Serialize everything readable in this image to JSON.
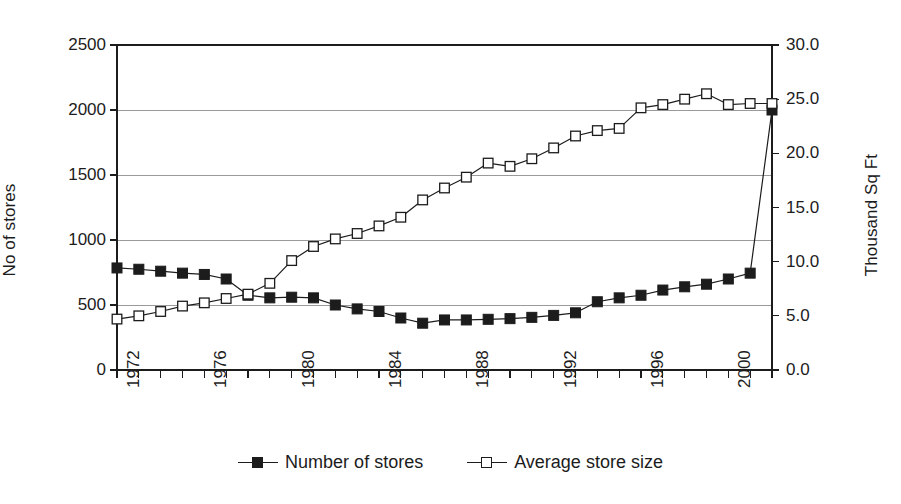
{
  "chart_data": {
    "type": "line",
    "title": "",
    "xlabel": "",
    "ylabel": "No of stores",
    "y2label": "Thousand Sq Ft",
    "grid": true,
    "legend_position": "bottom",
    "xlim": [
      1972,
      2002
    ],
    "ylim": [
      0,
      2500
    ],
    "y2lim": [
      0,
      30
    ],
    "x_tick_labels": [
      "1972",
      "1976",
      "1980",
      "1984",
      "1988",
      "1992",
      "1996",
      "2000"
    ],
    "x_tick_values": [
      1972,
      1976,
      1980,
      1984,
      1988,
      1992,
      1996,
      2000
    ],
    "y_tick_labels": [
      "0",
      "500",
      "1000",
      "1500",
      "2000",
      "2500"
    ],
    "y_tick_values": [
      0,
      500,
      1000,
      1500,
      2000,
      2500
    ],
    "y2_tick_labels": [
      "0.0",
      "5.0",
      "10.0",
      "15.0",
      "20.0",
      "25.0",
      "30.0"
    ],
    "y2_tick_values": [
      0,
      5,
      10,
      15,
      20,
      25,
      30
    ],
    "x": [
      1972,
      1973,
      1974,
      1975,
      1976,
      1977,
      1978,
      1979,
      1980,
      1981,
      1982,
      1983,
      1984,
      1985,
      1986,
      1987,
      1988,
      1989,
      1990,
      1991,
      1992,
      1993,
      1994,
      1995,
      1996,
      1997,
      1998,
      1999,
      2000,
      2001,
      2002
    ],
    "series": [
      {
        "name": "Number of stores",
        "axis": "left",
        "marker": "filled-square",
        "values": [
          785,
          775,
          760,
          745,
          735,
          700,
          575,
          555,
          560,
          555,
          500,
          470,
          450,
          400,
          360,
          385,
          385,
          390,
          395,
          405,
          420,
          440,
          525,
          555,
          575,
          615,
          640,
          660,
          700,
          745,
          2000
        ]
      },
      {
        "name": "Average store size",
        "axis": "right",
        "marker": "open-square",
        "values": [
          4.7,
          5.0,
          5.4,
          5.9,
          6.2,
          6.6,
          7.0,
          8.0,
          10.1,
          11.4,
          12.1,
          12.6,
          13.3,
          14.1,
          15.7,
          16.8,
          17.8,
          19.1,
          18.8,
          19.5,
          20.5,
          21.6,
          22.1,
          22.3,
          24.2,
          24.5,
          25.0,
          25.5,
          24.5,
          24.6,
          24.6
        ]
      }
    ]
  },
  "legend": {
    "entries": [
      {
        "label": "Number of stores",
        "marker": "filled-square"
      },
      {
        "label": "Average store size",
        "marker": "open-square"
      }
    ]
  },
  "style": {
    "line_color": "#1c1c1c",
    "grid_color": "#9a9a9a",
    "axis_color": "#1c1c1c",
    "background": "#ffffff"
  }
}
